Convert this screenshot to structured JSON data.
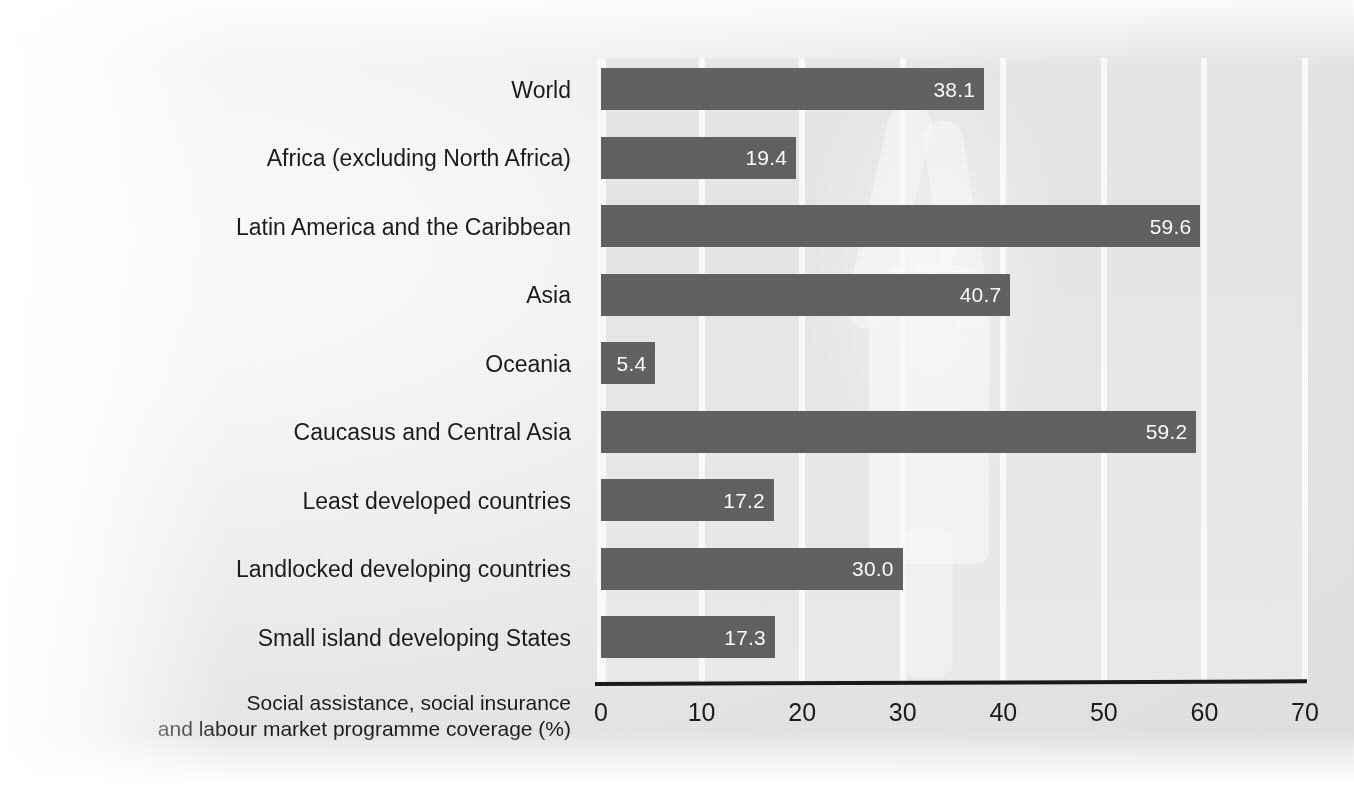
{
  "chart_data": {
    "type": "bar",
    "orientation": "horizontal",
    "title": "",
    "xlabel": "Social assistance, social insurance and labour market programme coverage (%)",
    "xlabel_lines": [
      "Social assistance, social insurance",
      "and labour market programme coverage (%)"
    ],
    "ylabel": "",
    "categories": [
      "World",
      "Africa (excluding North Africa)",
      "Latin America and the Caribbean",
      "Asia",
      "Oceania",
      "Caucasus and Central Asia",
      "Least developed countries",
      "Landlocked developing countries",
      "Small island developing States"
    ],
    "values": [
      38.1,
      19.4,
      59.6,
      40.7,
      5.4,
      59.2,
      17.2,
      30.0,
      17.3
    ],
    "value_labels": [
      "38.1",
      "19.4",
      "59.6",
      "40.7",
      "5.4",
      "59.2",
      "17.2",
      "30.0",
      "17.3"
    ],
    "xlim": [
      0,
      70
    ],
    "xticks": [
      0,
      10,
      20,
      30,
      40,
      50,
      60,
      70
    ],
    "xtick_labels": [
      "0",
      "10",
      "20",
      "30",
      "40",
      "50",
      "60",
      "70"
    ],
    "grid": "vertical-white-gridlines",
    "legend": "none",
    "colors": {
      "bar": "#636363",
      "value_label": "#ffffff",
      "plot_background": "#ececec",
      "gridline": "#ffffff",
      "axis_line": "#1a1a1a",
      "text": "#1c1c1c",
      "page_background": "#f0f0f0"
    }
  }
}
